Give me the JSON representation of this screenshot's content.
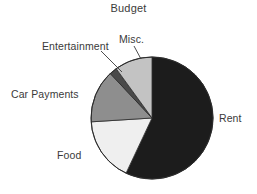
{
  "chart_data": {
    "type": "pie",
    "title": "Budget",
    "xlabel": "",
    "ylabel": "",
    "legend_position": "none",
    "grid": false,
    "labels_outside": true,
    "start_angle_deg": 0,
    "direction": "clockwise",
    "categories": [
      "Rent",
      "Food",
      "Car Payments",
      "Entertainment",
      "Misc."
    ],
    "values": [
      57,
      17,
      14,
      2,
      10
    ],
    "colors": [
      "#1c1c1c",
      "#efefef",
      "#8e8e8e",
      "#4a4a4a",
      "#c3c3c3"
    ],
    "slices": [
      {
        "label": "Rent",
        "value": 57,
        "start_deg": 0,
        "end_deg": 205.2,
        "color": "#1c1c1c"
      },
      {
        "label": "Food",
        "value": 17,
        "start_deg": 205.2,
        "end_deg": 266.4,
        "color": "#efefef"
      },
      {
        "label": "Car Payments",
        "value": 14,
        "start_deg": 266.4,
        "end_deg": 316.8,
        "color": "#8e8e8e"
      },
      {
        "label": "Entertainment",
        "value": 2,
        "start_deg": 316.8,
        "end_deg": 324.0,
        "color": "#4a4a4a"
      },
      {
        "label": "Misc.",
        "value": 10,
        "start_deg": 324.0,
        "end_deg": 360.0,
        "color": "#c3c3c3"
      }
    ],
    "annotations": [
      {
        "name": "entertainment-leader-line",
        "from_label": "Entertainment"
      },
      {
        "name": "misc-leader-line",
        "from_label": "Misc."
      }
    ]
  },
  "labels": {
    "title": "Budget",
    "rent": "Rent",
    "food": "Food",
    "car_payments": "Car Payments",
    "entertainment": "Entertainment",
    "misc": "Misc."
  },
  "style": {
    "background": "#ffffff",
    "text_color": "#3a3a3a",
    "outline_color": "#2b2b2b"
  }
}
